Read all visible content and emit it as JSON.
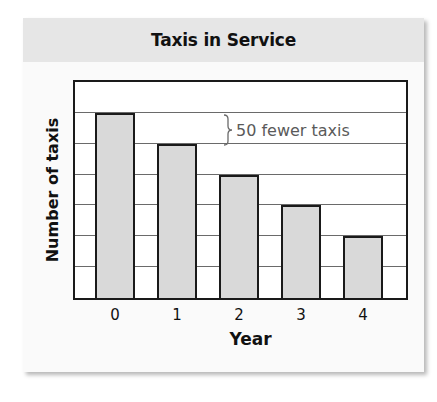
{
  "chart_data": {
    "type": "bar",
    "title": "Taxis in Service",
    "xlabel": "Year",
    "ylabel": "Number of taxis",
    "categories": [
      "0",
      "1",
      "2",
      "3",
      "4"
    ],
    "values": [
      300,
      250,
      200,
      150,
      100
    ],
    "ylim": [
      0,
      350
    ],
    "grid_step": 50,
    "y_tick_labels_shown": false,
    "grid": true,
    "annotations": [
      {
        "text": "50 fewer taxis",
        "type": "brace",
        "spans_gridlines": [
          300,
          250
        ]
      }
    ],
    "colors": {
      "bar_fill": "#d9d9d9",
      "bar_edge": "#1a1a1a",
      "title_band": "#e6e6e6",
      "annotation_text": "#5a5a5a"
    }
  }
}
